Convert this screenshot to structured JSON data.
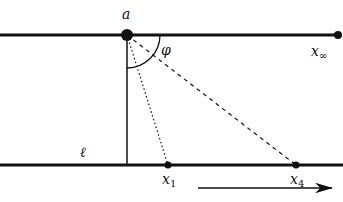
{
  "diagram": {
    "labels": {
      "a": "a",
      "phi": "φ",
      "x_inf": "x",
      "x_inf_sub": "∞",
      "ell": "ℓ",
      "x1": "x",
      "x1_sub": "1",
      "x4": "x",
      "x4_sub": "4"
    },
    "lines": {
      "top_line": {
        "y": 35,
        "x1": 0,
        "x2": 338
      },
      "bottom_line": {
        "y": 165,
        "x1": 0,
        "x2": 343
      }
    },
    "points": {
      "a": [
        127,
        35
      ],
      "x_inf": [
        338,
        35
      ],
      "x1": [
        168,
        165
      ],
      "x4": [
        296,
        165
      ]
    },
    "colors": {
      "stroke": "#111111",
      "background": "#ffffff"
    }
  }
}
